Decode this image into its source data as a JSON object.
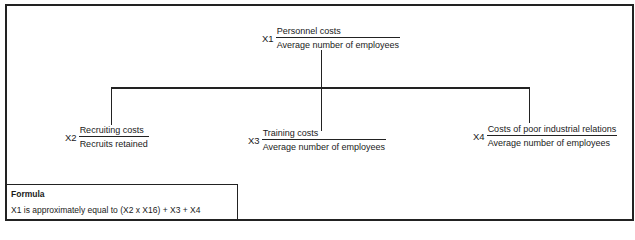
{
  "diagram": {
    "root": {
      "variable": "X1",
      "numerator": "Personnel costs",
      "denominator": "Average number of employees"
    },
    "children": [
      {
        "variable": "X2",
        "numerator": "Recruiting costs",
        "denominator": "Recruits retained"
      },
      {
        "variable": "X3",
        "numerator": "Training costs",
        "denominator": "Average number of employees"
      },
      {
        "variable": "X4",
        "numerator": "Costs of poor industrial relations",
        "denominator": "Average number of employees"
      }
    ],
    "formula": {
      "title": "Formula",
      "expression": "X1 is approximately equal to (X2 x X16) + X3 + X4"
    }
  }
}
